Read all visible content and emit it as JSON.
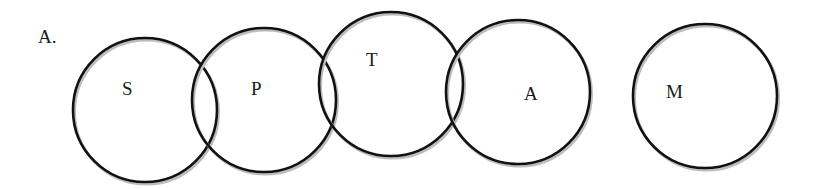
{
  "diagram": {
    "title": "A.",
    "stroke_color": "#111111",
    "shadow_color": "#bdbdbd",
    "circles": [
      {
        "label": "S",
        "cx": 145,
        "cy": 110,
        "r": 72,
        "label_x": 122,
        "label_y": 95
      },
      {
        "label": "P",
        "cx": 264,
        "cy": 100,
        "r": 72,
        "label_x": 251,
        "label_y": 95
      },
      {
        "label": "T",
        "cx": 391,
        "cy": 84,
        "r": 72,
        "label_x": 366,
        "label_y": 66
      },
      {
        "label": "A",
        "cx": 518,
        "cy": 92,
        "r": 72,
        "label_x": 524,
        "label_y": 100
      },
      {
        "label": "M",
        "cx": 705,
        "cy": 96,
        "r": 72,
        "label_x": 666,
        "label_y": 98
      }
    ],
    "relationships": "S overlaps P; P overlaps T; T overlaps A; M is disjoint"
  }
}
